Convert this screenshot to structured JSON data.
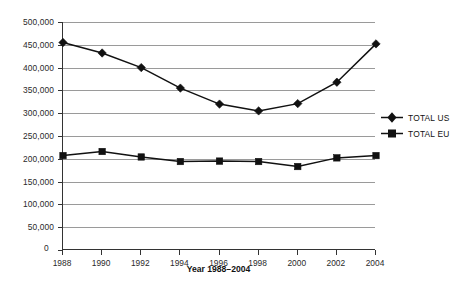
{
  "chart_data": {
    "type": "line",
    "title": "",
    "xlabel": "Year 1988–2004",
    "ylabel": "",
    "grid": true,
    "legend_position": "right",
    "categories": [
      "1988",
      "1990",
      "1992",
      "1994",
      "1996",
      "1998",
      "2000",
      "2002",
      "2004"
    ],
    "xlim": [
      1988,
      2004
    ],
    "ylim": [
      0,
      500000
    ],
    "ytick_labels": [
      "500,000",
      "450,000",
      "400,000",
      "350,000",
      "300,000",
      "250,000",
      "200,000",
      "150,000",
      "100,000",
      "50,000",
      "0"
    ],
    "ytick_values": [
      500000,
      450000,
      400000,
      350000,
      300000,
      250000,
      200000,
      150000,
      100000,
      50000,
      0
    ],
    "series": [
      {
        "name": "TOTAL US",
        "marker": "diamond",
        "color": "#111111",
        "values": [
          455000,
          432000,
          400000,
          355000,
          320000,
          305000,
          321000,
          368000,
          452000
        ]
      },
      {
        "name": "TOTAL EU",
        "marker": "square",
        "color": "#111111",
        "values": [
          207000,
          216000,
          204000,
          194000,
          195000,
          194000,
          183000,
          202000,
          207000
        ]
      }
    ]
  },
  "legend": {
    "items": [
      {
        "label": "TOTAL US",
        "marker": "diamond"
      },
      {
        "label": "TOTAL EU",
        "marker": "square"
      }
    ]
  },
  "axis": {
    "x_title": "Year 1988–2004",
    "zero_label": "0"
  }
}
